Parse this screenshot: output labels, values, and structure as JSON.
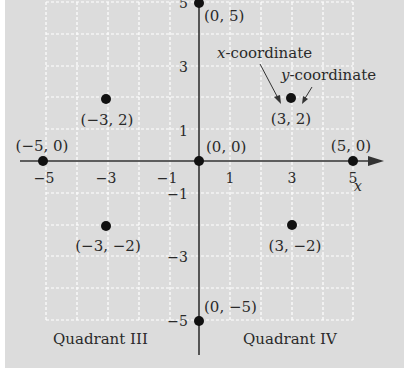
{
  "diagram": {
    "colors": {
      "panel": "#dcdcdc",
      "grid": "#ffffff",
      "axis": "#333333",
      "point": "#111111",
      "text": "#2a2a2a"
    },
    "axes": {
      "x_label": "x",
      "x_range": [
        -5,
        5
      ],
      "y_range": [
        -5,
        5
      ],
      "x_ticks": [
        "-5",
        "-3",
        "-1",
        "1",
        "3",
        "5"
      ],
      "y_ticks": [
        "5",
        "3",
        "1",
        "-1",
        "-3",
        "-5"
      ]
    },
    "points": [
      {
        "x": 0,
        "y": 5,
        "label": "(0, 5)"
      },
      {
        "x": -3,
        "y": 2,
        "label": "(−3, 2)"
      },
      {
        "x": 3,
        "y": 2,
        "label": "(3, 2)"
      },
      {
        "x": -5,
        "y": 0,
        "label": "(−5, 0)"
      },
      {
        "x": 0,
        "y": 0,
        "label": "(0, 0)"
      },
      {
        "x": 5,
        "y": 0,
        "label": "(5, 0)"
      },
      {
        "x": -3,
        "y": -2,
        "label": "(−3, −2)"
      },
      {
        "x": 3,
        "y": -2,
        "label": "(3, −2)"
      },
      {
        "x": 0,
        "y": -5,
        "label": "(0, −5)"
      }
    ],
    "annotations": {
      "x_coordinate": {
        "italic": "x",
        "rest": "-coordinate"
      },
      "y_coordinate": {
        "italic": "y",
        "rest": "-coordinate"
      }
    },
    "quadrants": {
      "III": "Quadrant III",
      "IV": "Quadrant IV"
    }
  }
}
